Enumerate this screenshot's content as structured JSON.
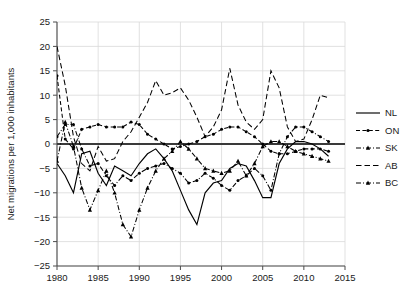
{
  "chart_data": {
    "type": "line",
    "title": "",
    "xlabel": "",
    "ylabel": "Net migrations per 1,000 inhabitants",
    "xlim": [
      1980,
      2015
    ],
    "ylim": [
      -25,
      25
    ],
    "xticks": [
      "1980",
      "1985",
      "1990",
      "1995",
      "2000",
      "2005",
      "2010",
      "2015"
    ],
    "yticks": [
      "25",
      "20",
      "15",
      "10",
      "5",
      "0",
      "−5",
      "−10",
      "−15",
      "−20",
      "−25"
    ],
    "grid": true,
    "legend_position": "right",
    "zero_line": 0,
    "x": [
      1980,
      1981,
      1982,
      1983,
      1984,
      1985,
      1986,
      1987,
      1988,
      1989,
      1990,
      1991,
      1992,
      1993,
      1994,
      1995,
      1996,
      1997,
      1998,
      1999,
      2000,
      2001,
      2002,
      2003,
      2004,
      2005,
      2006,
      2007,
      2008,
      2009,
      2010,
      2011,
      2012,
      2013
    ],
    "series": [
      {
        "name": "NL",
        "style": "solid",
        "marker": "none",
        "color": "#000000",
        "values": [
          -4.0,
          -6.5,
          -10.0,
          -2.0,
          -1.5,
          -6.0,
          -8.5,
          -4.5,
          -5.5,
          -6.5,
          -4.0,
          -2.0,
          -1.0,
          -3.0,
          -5.5,
          -9.5,
          -13.5,
          -16.5,
          -10.0,
          -8.0,
          -7.5,
          -5.0,
          -4.0,
          -4.5,
          -7.5,
          -11.0,
          -11.0,
          -4.0,
          -1.0,
          0.5,
          0.5,
          0.0,
          -1.0,
          -2.5
        ]
      },
      {
        "name": "ON",
        "style": "dashed",
        "marker": "dot",
        "color": "#000000",
        "values": [
          14.0,
          1.0,
          -1.0,
          3.0,
          3.5,
          4.0,
          3.5,
          3.5,
          3.5,
          4.5,
          4.0,
          2.0,
          1.0,
          0.0,
          -1.0,
          -0.5,
          0.0,
          0.5,
          1.5,
          2.0,
          3.0,
          3.5,
          3.5,
          2.5,
          1.5,
          0.0,
          -1.5,
          -2.0,
          -2.0,
          -1.5,
          -1.0,
          -1.0,
          -1.0,
          -1.5
        ]
      },
      {
        "name": "SK",
        "style": "dashdot",
        "marker": "dot",
        "color": "#000000",
        "values": [
          1.5,
          4.0,
          4.0,
          -1.0,
          -4.5,
          -4.0,
          -6.5,
          -8.5,
          -6.5,
          -7.5,
          -6.0,
          -5.0,
          -4.5,
          -4.0,
          -5.0,
          -6.0,
          -8.0,
          -7.5,
          -6.0,
          -7.0,
          -8.5,
          -9.5,
          -7.5,
          -6.5,
          -5.0,
          -6.5,
          -9.5,
          -2.0,
          1.5,
          3.5,
          3.5,
          2.5,
          1.5,
          0.5
        ]
      },
      {
        "name": "AB",
        "style": "dashed-long",
        "marker": "none",
        "color": "#000000",
        "values": [
          20.0,
          12.0,
          1.5,
          -4.0,
          -5.5,
          -0.5,
          -3.5,
          -3.0,
          0.5,
          2.5,
          5.5,
          8.5,
          13.0,
          10.0,
          10.5,
          11.5,
          9.0,
          5.5,
          1.5,
          3.5,
          7.0,
          15.5,
          8.0,
          4.5,
          3.0,
          5.0,
          15.0,
          11.5,
          3.5,
          0.5,
          1.0,
          5.0,
          10.0,
          9.5
        ]
      },
      {
        "name": "BC",
        "style": "dashdot-tri",
        "marker": "tri",
        "color": "#000000",
        "values": [
          -3.5,
          4.5,
          -0.5,
          -9.0,
          -13.5,
          -9.5,
          -5.5,
          -10.0,
          -16.5,
          -19.0,
          -13.5,
          -9.0,
          -5.5,
          -3.0,
          -1.5,
          0.5,
          -1.0,
          -3.0,
          -5.0,
          -5.5,
          -6.0,
          -5.5,
          -3.5,
          -6.5,
          -4.0,
          -0.5,
          0.5,
          0.5,
          -0.5,
          -1.5,
          -2.0,
          -2.5,
          -3.0,
          -3.5
        ]
      }
    ],
    "legend": [
      {
        "label": "NL",
        "style": "solid",
        "marker": "none"
      },
      {
        "label": "ON",
        "style": "dashed",
        "marker": "dot"
      },
      {
        "label": "SK",
        "style": "dashdot",
        "marker": "tri"
      },
      {
        "label": "AB",
        "style": "dashed-long",
        "marker": "none"
      },
      {
        "label": "BC",
        "style": "dashdot-tri",
        "marker": "tri"
      }
    ]
  }
}
